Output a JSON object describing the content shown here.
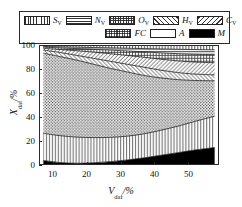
{
  "chart_data": {
    "type": "area",
    "title": "",
    "xlabel": "V_daf/%",
    "ylabel": "X_daf/%",
    "xlim": [
      6,
      59
    ],
    "ylim": [
      0,
      100
    ],
    "xticks": [
      10,
      20,
      30,
      40,
      50
    ],
    "yticks": [
      0,
      20,
      40,
      60,
      80,
      100
    ],
    "grid": false,
    "legend_position": "top",
    "stacking": "cumulative-from-bottom",
    "x": [
      7,
      12,
      17,
      22,
      27,
      32,
      37,
      42,
      47,
      52,
      58
    ],
    "series": [
      {
        "name": "M",
        "label": "M",
        "pattern": "solid-black",
        "color": "#000000",
        "cumulative_top": [
          3.0,
          1.2,
          0.6,
          1.0,
          2.0,
          3.4,
          5.2,
          7.4,
          9.6,
          11.8,
          14.0
        ]
      },
      {
        "name": "A",
        "label": "A",
        "pattern": "blank-white",
        "color": "#ffffff",
        "cumulative_top": [
          26.0,
          24.0,
          22.8,
          22.4,
          22.6,
          23.6,
          25.6,
          28.6,
          32.0,
          36.0,
          40.5
        ]
      },
      {
        "name": "FC",
        "label": "FC",
        "pattern": "stipple-dots",
        "color": "#b9b9b9",
        "cumulative_top": [
          94.0,
          91.0,
          88.0,
          84.5,
          81.0,
          78.0,
          75.0,
          73.0,
          71.5,
          70.8,
          70.5
        ]
      },
      {
        "name": "C_V",
        "label": "C",
        "sub": "V",
        "pattern": "diagonal-hatch-back",
        "color": "#cfcfcf",
        "cumulative_top": [
          96.5,
          94.5,
          92.0,
          89.5,
          87.0,
          84.5,
          82.0,
          79.5,
          77.5,
          76.2,
          75.5
        ]
      },
      {
        "name": "H_V",
        "label": "H",
        "sub": "V",
        "pattern": "diagonal-hatch-fwd",
        "color": "#d8d8d8",
        "cumulative_top": [
          98.0,
          97.0,
          96.0,
          94.8,
          93.4,
          92.0,
          90.4,
          88.8,
          87.4,
          86.4,
          85.8
        ]
      },
      {
        "name": "O_V",
        "label": "O",
        "sub": "V",
        "pattern": "cross-grid",
        "color": "#c4c4c4",
        "cumulative_top": [
          99.0,
          98.4,
          97.8,
          97.2,
          96.5,
          95.8,
          95.0,
          94.2,
          93.5,
          93.0,
          92.6
        ]
      },
      {
        "name": "N_V",
        "label": "N",
        "sub": "V",
        "pattern": "horizontal-lines",
        "color": "#d0d0d0",
        "cumulative_top": [
          99.6,
          99.3,
          99.0,
          98.7,
          98.4,
          98.1,
          97.8,
          97.5,
          97.2,
          97.0,
          96.8
        ]
      },
      {
        "name": "S_V",
        "label": "S",
        "sub": "V",
        "pattern": "vertical-lines",
        "color": "#e2e2e2",
        "cumulative_top": [
          100,
          100,
          100,
          100,
          100,
          100,
          100,
          100,
          100,
          100,
          100
        ]
      }
    ]
  },
  "legend": {
    "row1": [
      {
        "label": "S",
        "sub": "V",
        "pattern": "vertical-lines"
      },
      {
        "label": "N",
        "sub": "V",
        "pattern": "horizontal-lines"
      },
      {
        "label": "O",
        "sub": "V",
        "pattern": "cross-grid"
      },
      {
        "label": "H",
        "sub": "V",
        "pattern": "diagonal-hatch-fwd"
      },
      {
        "label": "C",
        "sub": "V",
        "pattern": "diagonal-hatch-back"
      }
    ],
    "row2": [
      {
        "label": "FC",
        "sub": "",
        "pattern": "stipple-dots"
      },
      {
        "label": "A",
        "sub": "",
        "pattern": "blank-white"
      },
      {
        "label": "M",
        "sub": "",
        "pattern": "solid-black"
      }
    ]
  },
  "axes": {
    "y_title_main": "X",
    "y_title_sub": "daf",
    "y_title_unit": "/%",
    "x_title_main": "V",
    "x_title_sub": "daf",
    "x_title_unit": "/%",
    "yticks": [
      "100",
      "80",
      "60",
      "40",
      "20",
      "0"
    ],
    "xticks": [
      "10",
      "20",
      "30",
      "40",
      "50"
    ]
  },
  "colors": {
    "frame": "#2b2b2b",
    "black": "#000000",
    "white": "#ffffff"
  }
}
